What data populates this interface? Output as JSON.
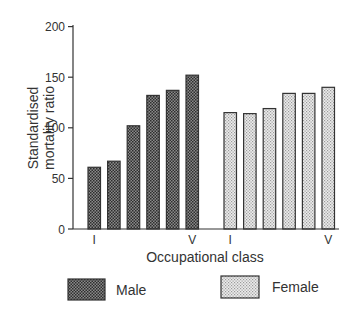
{
  "chart_data": {
    "type": "bar",
    "title": "",
    "xlabel": "Occupational class",
    "ylabel": "Standardised mortality ratio",
    "ylabel_lines": [
      "Standardised",
      "mortality  ratio"
    ],
    "ylim": [
      0,
      200
    ],
    "yticks": [
      0,
      50,
      100,
      150,
      200
    ],
    "grid": false,
    "legend_position": "bottom",
    "groups": [
      {
        "name": "Male",
        "categories": [
          "I",
          "II",
          "IIIN",
          "IIIM",
          "IV",
          "V"
        ],
        "category_labels_shown": [
          "I",
          "",
          "",
          "",
          "",
          "V"
        ],
        "values": [
          61,
          67,
          102,
          132,
          137,
          152
        ]
      },
      {
        "name": "Female",
        "categories": [
          "I",
          "II",
          "IIIN",
          "IIIM",
          "IV",
          "V"
        ],
        "category_labels_shown": [
          "I",
          "",
          "",
          "",
          "",
          "V"
        ],
        "values": [
          115,
          114,
          119,
          134,
          134,
          140
        ]
      }
    ],
    "series": [
      {
        "name": "Male",
        "values": [
          61,
          67,
          102,
          132,
          137,
          152
        ]
      },
      {
        "name": "Female",
        "values": [
          115,
          114,
          119,
          134,
          134,
          140
        ]
      }
    ]
  },
  "legend": {
    "male_label": "Male",
    "female_label": "Female"
  },
  "colors": {
    "axis": "#333333",
    "male_fill": "#5a5a5a",
    "female_fill": "#d8d8d8"
  }
}
